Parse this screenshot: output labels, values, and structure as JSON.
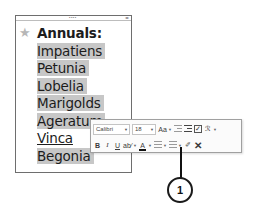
{
  "document": {
    "bullet_icon": "star-icon",
    "heading": "Annuals:",
    "items": [
      {
        "label": "Impatiens",
        "highlighted": true
      },
      {
        "label": "Petunia",
        "highlighted": true
      },
      {
        "label": "Lobelia",
        "highlighted": true
      },
      {
        "label": "Marigolds",
        "highlighted": true
      },
      {
        "label": "Ageratum",
        "highlighted": true
      },
      {
        "label": "Vinca",
        "highlighted": false,
        "underlined": true
      },
      {
        "label": "Begonia",
        "highlighted": true
      }
    ]
  },
  "mini_toolbar": {
    "font_name": "Calibri",
    "font_size": "18",
    "row1_buttons": [
      "change-case",
      "decrease-indent",
      "increase-indent",
      "checkbox",
      "styles"
    ],
    "row2_buttons": [
      "bold",
      "italic",
      "underline",
      "strikethrough",
      "font-color",
      "bullets",
      "numbering",
      "clear-formatting",
      "delete"
    ],
    "bold_label": "B",
    "italic_label": "I",
    "underline_label": "U",
    "font_color_label": "A",
    "change_case_label": "Aa"
  },
  "callout": {
    "number": "1"
  },
  "colors": {
    "highlight": "#c7c7c7",
    "border": "#6e6e6e",
    "star": "#b7b7b7"
  }
}
